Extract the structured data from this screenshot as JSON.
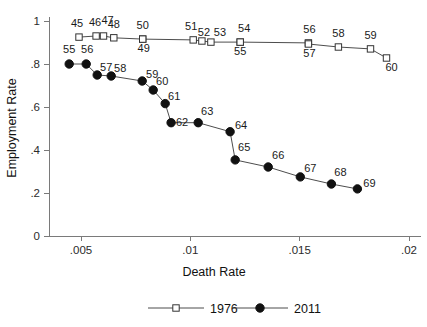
{
  "chart_data": {
    "type": "scatter",
    "title": "",
    "xlabel": "Death Rate",
    "ylabel": "Employment Rate",
    "xlim": [
      0.0037,
      0.0205
    ],
    "ylim": [
      0,
      1.03
    ],
    "grid": false,
    "legend_position": "bottom",
    "xticks": [
      0.005,
      0.01,
      0.015,
      0.02
    ],
    "xticklabels": [
      ".005",
      ".01",
      ".015",
      ".02"
    ],
    "yticks": [
      0,
      0.2,
      0.4,
      0.6,
      0.8,
      1
    ],
    "yticklabels": [
      "0",
      ".2",
      ".4",
      ".6",
      ".8",
      "1"
    ],
    "series": [
      {
        "name": "1976",
        "marker": "open-square",
        "point_labels": [
          "45",
          "46",
          "47",
          "48",
          "49",
          "50",
          "51",
          "52",
          "53",
          "54",
          "55",
          "56",
          "57",
          "58",
          "59",
          "60"
        ],
        "x": [
          0.00491,
          0.00569,
          0.00603,
          0.0065,
          0.00782,
          0.00782,
          0.01013,
          0.01053,
          0.01094,
          0.01228,
          0.01228,
          0.0154,
          0.0154,
          0.01677,
          0.01824,
          0.01897
        ],
        "y": [
          0.925,
          0.93,
          0.93,
          0.922,
          0.916,
          0.916,
          0.912,
          0.907,
          0.902,
          0.902,
          0.902,
          0.898,
          0.893,
          0.879,
          0.87,
          0.828
        ]
      },
      {
        "name": "2011",
        "marker": "filled-circle",
        "point_labels": [
          "55",
          "56",
          "57",
          "58",
          "59",
          "60",
          "61",
          "62",
          "63",
          "64",
          "65",
          "66",
          "67",
          "68",
          "69"
        ],
        "x": [
          0.00446,
          0.00524,
          0.00574,
          0.00638,
          0.0078,
          0.0083,
          0.00885,
          0.00912,
          0.01036,
          0.01182,
          0.01205,
          0.01356,
          0.01503,
          0.01645,
          0.01764
        ],
        "y": [
          0.8,
          0.8,
          0.749,
          0.744,
          0.721,
          0.679,
          0.616,
          0.527,
          0.527,
          0.485,
          0.354,
          0.321,
          0.275,
          0.242,
          0.219
        ]
      }
    ]
  },
  "legend": {
    "entries": [
      {
        "label": "1976",
        "marker": "open-square"
      },
      {
        "label": "2011",
        "marker": "filled-circle"
      }
    ]
  },
  "colors": {
    "axis": "#7a7a7a",
    "line": "#4d4d4d",
    "marker_fill_1976": "#ffffff",
    "marker_stroke_1976": "#333333",
    "marker_2011": "#111111",
    "text": "#111111",
    "background": "#ffffff"
  }
}
